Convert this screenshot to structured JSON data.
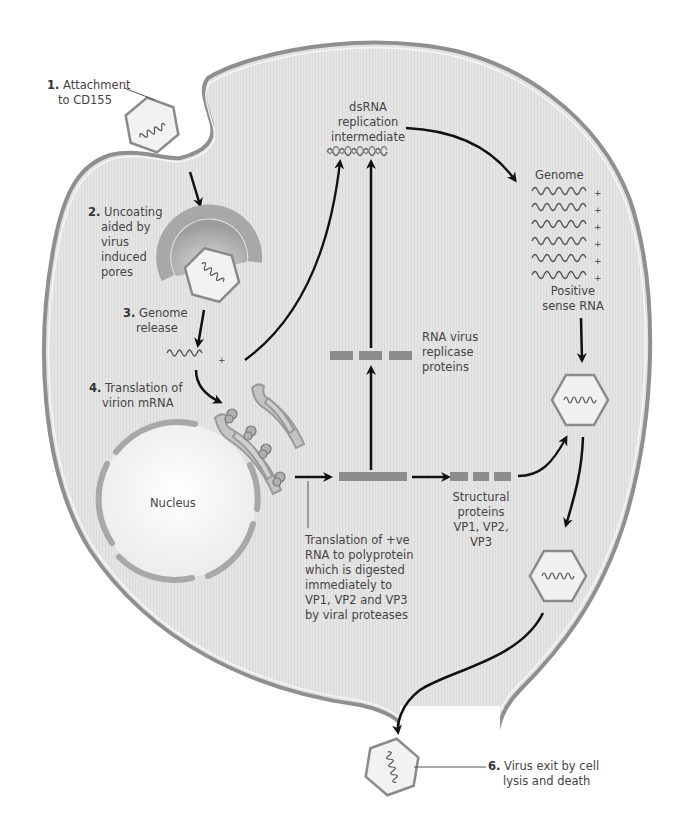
{
  "diagram": {
    "type": "poliovirus-replication-cycle",
    "colors": {
      "cytoplasm": "#e6e6e6",
      "membrane_outer": "#9a9a9a",
      "membrane_inner": "#f7f7f7",
      "organelle": "#b8b8b8",
      "protein_bar": "#8c8c8c",
      "arrow": "#111111",
      "capsid_stroke": "#8a8a8a",
      "capsid_fill": "#f1f1f1"
    },
    "steps": [
      {
        "number": "1.",
        "text_line1": "Attachment",
        "text_line2": "to CD155"
      },
      {
        "number": "2.",
        "text_line1": "Uncoating",
        "text_line2": "aided by",
        "text_line3": "virus",
        "text_line4": "induced",
        "text_line5": "pores"
      },
      {
        "number": "3.",
        "text_line1": "Genome",
        "text_line2": "release"
      },
      {
        "number": "4.",
        "text_line1": "Translation of",
        "text_line2": "virion mRNA"
      },
      {
        "number": "6.",
        "text_line1": "Virus exit by cell",
        "text_line2": "lysis and death"
      }
    ],
    "labels": {
      "dsrna_line1": "dsRNA",
      "dsrna_line2": "replication",
      "dsrna_line3": "intermediate",
      "genome_title": "Genome",
      "genome_plus": "+",
      "positive_line1": "Positive",
      "positive_line2": "sense RNA",
      "replicase_line1": "RNA virus",
      "replicase_line2": "replicase",
      "replicase_line3": "proteins",
      "nucleus": "Nucleus",
      "structural_line1": "Structural",
      "structural_line2": "proteins",
      "structural_line3": "VP1, VP2,",
      "structural_line4": "VP3",
      "translation_line1": "Translation of +ve",
      "translation_line2": "RNA to polyprotein",
      "translation_line3": "which is digested",
      "translation_line4": "immediately to",
      "translation_line5": "VP1, VP2 and VP3",
      "translation_line6": "by viral proteases",
      "rna_plus": "+"
    },
    "genome_strand_count": 6
  }
}
